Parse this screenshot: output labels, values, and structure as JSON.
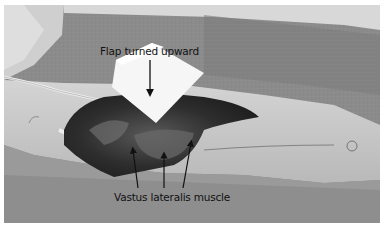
{
  "figure": {
    "kind": "grayscale surgical photograph",
    "annotations": {
      "top_label": "Flap turned upward",
      "bottom_label": "Vastus lateralis muscle"
    },
    "arrows": {
      "top_count": 1,
      "bottom_count": 3
    },
    "colors": {
      "background": "#ffffff",
      "drape": "#8a8a8a",
      "skin": "#c8c8c8",
      "gauze": "#f6f6f6",
      "wound": "#3a3a3a",
      "text": "#111111"
    }
  }
}
